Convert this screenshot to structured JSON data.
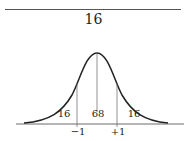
{
  "header": {
    "page_number": "16"
  },
  "diagram": {
    "type": "normal-distribution-curve",
    "region_labels": {
      "left_tail": "16",
      "center": "68",
      "right_tail": "16"
    },
    "axis_labels": {
      "minus_one": "−1",
      "plus_one": "+1"
    },
    "stroke_color": "#222222"
  }
}
